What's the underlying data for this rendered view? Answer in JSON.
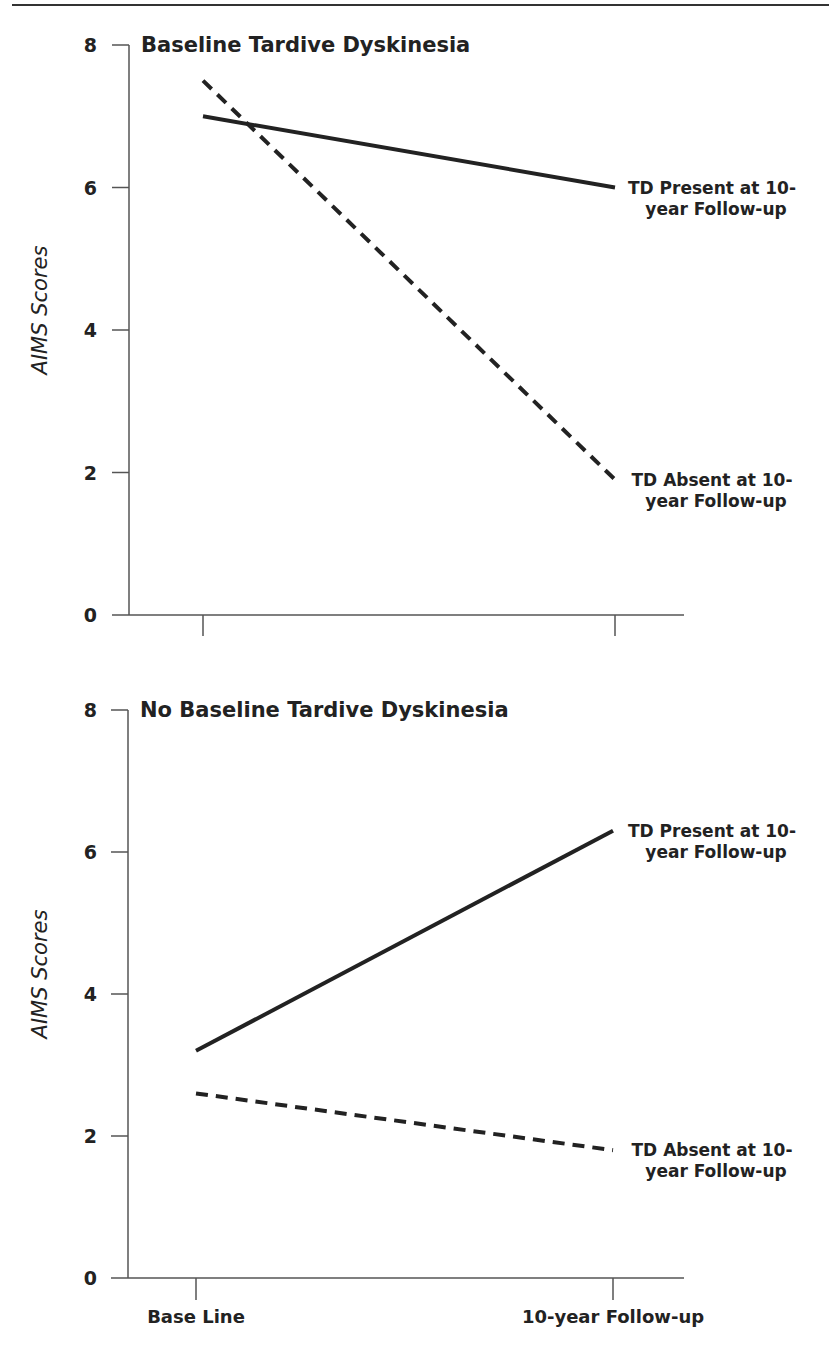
{
  "chart_data": [
    {
      "type": "line",
      "title": "Baseline Tardive Dyskinesia",
      "xlabel": "",
      "ylabel": "AIMS Scores",
      "categories": [
        "Base Line",
        "10-year Follow-up"
      ],
      "show_category_labels": false,
      "ylim": [
        0,
        8
      ],
      "yticks": [
        0,
        2,
        4,
        6,
        8
      ],
      "grid": false,
      "legend": "inline labels at line ends",
      "series": [
        {
          "name": "TD Present at 10-year Follow-up",
          "label_lines": [
            "TD Present at 10-",
            "year Follow-up"
          ],
          "style": "solid",
          "values": [
            7.0,
            6.0
          ]
        },
        {
          "name": "TD Absent at 10-year Follow-up",
          "label_lines": [
            "TD Absent at 10-",
            "year Follow-up"
          ],
          "style": "dashed",
          "values": [
            7.5,
            1.9
          ]
        }
      ]
    },
    {
      "type": "line",
      "title": "No Baseline Tardive Dyskinesia",
      "xlabel": "",
      "ylabel": "AIMS Scores",
      "categories": [
        "Base Line",
        "10-year Follow-up"
      ],
      "show_category_labels": true,
      "ylim": [
        0,
        8
      ],
      "yticks": [
        0,
        2,
        4,
        6,
        8
      ],
      "grid": false,
      "legend": "inline labels at line ends",
      "series": [
        {
          "name": "TD Present at 10-year Follow-up",
          "label_lines": [
            "TD Present at 10-",
            "year Follow-up"
          ],
          "style": "solid",
          "values": [
            3.2,
            6.3
          ]
        },
        {
          "name": "TD Absent at 10-year Follow-up",
          "label_lines": [
            "TD Absent at 10-",
            "year Follow-up"
          ],
          "style": "dashed",
          "values": [
            2.6,
            1.8
          ]
        }
      ]
    }
  ],
  "colors": {
    "ink": "#222222",
    "axis": "#555555",
    "background": "#ffffff"
  }
}
